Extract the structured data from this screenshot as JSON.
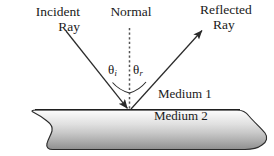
{
  "diagram": {
    "labels": {
      "incident_ray_line1": "Incident",
      "incident_ray_line2": "Ray",
      "normal": "Normal",
      "reflected_ray_line1": "Reflected",
      "reflected_ray_line2": "Ray",
      "medium_1": "Medium 1",
      "medium_2": "Medium 2",
      "theta_incident_symbol": "θ",
      "theta_incident_subscript": "i",
      "theta_reflected_symbol": "θ",
      "theta_reflected_subscript": "r"
    },
    "colors": {
      "background": "#ffffff",
      "ink": "#1a1a1a",
      "ray_stroke": "#2b2b2b",
      "normal_stroke": "#4a4a4a",
      "slab_outline": "#2b2b2b",
      "slab_gradient_top": "#fbfbfb",
      "slab_gradient_bottom": "#979797"
    },
    "geometry": {
      "incidence_point_x": 129,
      "incidence_point_y": 110,
      "normal_top_y": 28,
      "normal_bottom_y": 110,
      "incident_ray_start_x": 66,
      "incident_ray_start_y": 31,
      "reflected_ray_end_x": 203,
      "reflected_ray_end_y": 30,
      "surface_left_x": 36,
      "surface_right_x": 245,
      "surface_y": 110,
      "slab_bottom_y": 150,
      "angle_incidence_degrees": 38,
      "angle_reflection_degrees": 38
    }
  }
}
